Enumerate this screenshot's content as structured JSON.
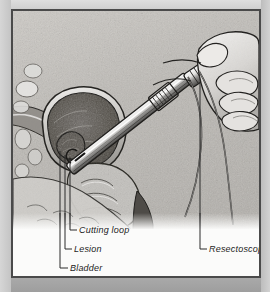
{
  "figure": {
    "style": "stippled pen-and-ink grayscale illustration",
    "frame": {
      "border_color": "#4a4a4a",
      "margin_color": "#c9c9c7",
      "panel_color": "#fbfbfa"
    }
  },
  "labels": [
    {
      "id": "cutting-loop",
      "text": "Cutting loop",
      "side": "left",
      "x": 66,
      "y": 218
    },
    {
      "id": "lesion",
      "text": "Lesion",
      "side": "left",
      "x": 61,
      "y": 237
    },
    {
      "id": "bladder",
      "text": "Bladder",
      "side": "left",
      "x": 57,
      "y": 256
    },
    {
      "id": "resectoscope",
      "text": "Resectoscope",
      "side": "right",
      "x": 196,
      "y": 237
    }
  ],
  "anatomy": {
    "structures": [
      "bladder",
      "lesion",
      "urethra",
      "prostate",
      "pelvic soft tissue"
    ]
  },
  "instrument": {
    "name": "Resectoscope",
    "parts": [
      "sheath",
      "cutting loop",
      "eyepiece ring handle",
      "light cable",
      "electrode cable"
    ],
    "held_by": "gloved hand"
  },
  "colors": {
    "ink": "#1d1d1d",
    "leader": "#2b2b2b",
    "tissue_light": "#cfcdc9",
    "tissue_mid": "#a8a6a2",
    "tissue_dark": "#6d6b67",
    "cavity": "#55514d",
    "metal_light": "#f2f1ef",
    "metal_dark": "#3a3a3a"
  }
}
